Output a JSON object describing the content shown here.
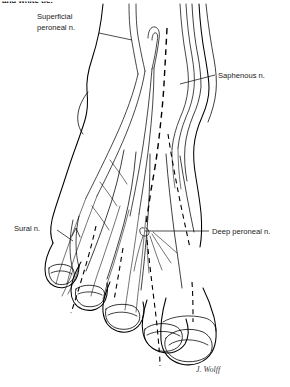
{
  "figure": {
    "title_fragment": "and white tie.",
    "view": "dorsal view of right foot and ankle",
    "signature": "J. Wolff"
  },
  "labels": [
    {
      "id": "superficial-peroneal",
      "line1": "Superficial",
      "line2": "peroneal n.",
      "text_x": 37,
      "text_y1": 19,
      "text_y2": 30,
      "leader": "M 99 33 L 132 40"
    },
    {
      "id": "saphenous",
      "line1": "Saphenous n.",
      "line2": "",
      "text_x": 218,
      "text_y1": 78,
      "text_y2": 0,
      "leader": "M 215 75 L 180 84"
    },
    {
      "id": "sural",
      "line1": "Sural n.",
      "line2": "",
      "text_x": 14,
      "text_y1": 231,
      "text_y2": 0,
      "leader": "M 57 230 L 72 240"
    },
    {
      "id": "deep-peroneal",
      "line1": "Deep peroneal n.",
      "line2": "",
      "text_x": 212,
      "text_y1": 234,
      "text_y2": 0,
      "leader": "M 209 231 L 145 231"
    }
  ],
  "colors": {
    "ink": "#000000",
    "label_ink": "#1a1a1a",
    "background": "#ffffff"
  },
  "nerve_legend": {
    "solid": "superficial cutaneous nerve (solid line)",
    "dashed": "deep nerve course (dashed line)"
  },
  "toes": [
    {
      "name": "fifth-toe",
      "index": 5
    },
    {
      "name": "fourth-toe",
      "index": 4
    },
    {
      "name": "third-toe",
      "index": 3
    },
    {
      "name": "second-toe",
      "index": 2
    },
    {
      "name": "great-toe",
      "index": 1
    }
  ]
}
